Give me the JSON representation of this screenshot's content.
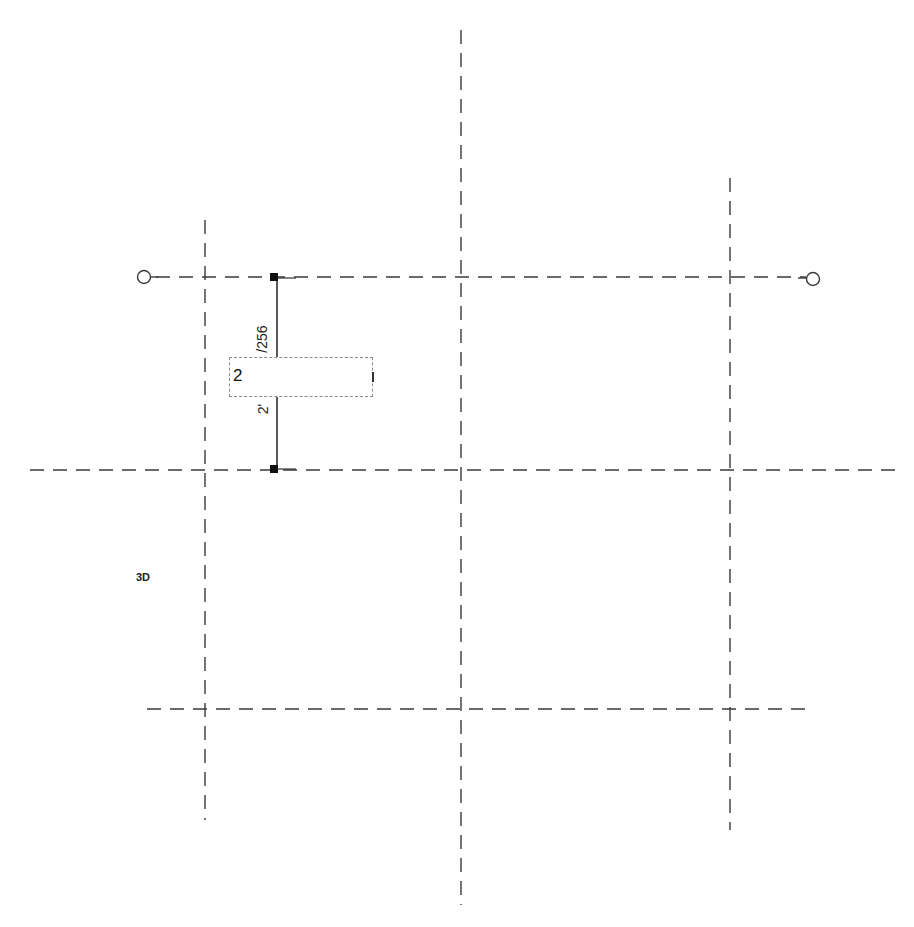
{
  "canvas": {
    "background": "#ffffff",
    "line_color": "#3a3a3a",
    "dimension_color": "#111111"
  },
  "grids": {
    "horizontal": [
      {
        "name": "grid-h-top",
        "y": 277,
        "x1": 148,
        "x2": 810,
        "bubbles": true
      },
      {
        "name": "grid-h-middle",
        "y": 470,
        "x1": 30,
        "x2": 897,
        "bubbles": false
      },
      {
        "name": "grid-h-bottom",
        "y": 709,
        "x1": 147,
        "x2": 812,
        "bubbles": false
      }
    ],
    "vertical": [
      {
        "name": "grid-v-left",
        "x": 205,
        "y1": 220,
        "y2": 820
      },
      {
        "name": "grid-v-middle",
        "x": 461,
        "y1": 30,
        "y2": 905
      },
      {
        "name": "grid-v-right",
        "x": 730,
        "y1": 178,
        "y2": 830
      }
    ]
  },
  "dimension": {
    "top_value": "/256",
    "bottom_value": "2'",
    "x": 275,
    "y1": 277,
    "y2": 470
  },
  "edit_field": {
    "value": "2"
  },
  "view_label": "3D"
}
